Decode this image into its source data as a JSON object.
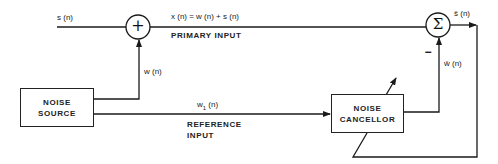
{
  "diagram": {
    "nodes": {
      "noise_source": {
        "line1": "NOISE",
        "line2": "SOURCE"
      },
      "noise_cancellor": {
        "line1": "NOISE",
        "line2": "CANCELLOR"
      },
      "adder": {
        "symbol": "+"
      },
      "summer": {
        "symbol": "Σ",
        "minus_sign": "−"
      }
    },
    "signals": {
      "s": "s (n)",
      "x": "x (n) = w (n) + s (n)",
      "primary_input": "PRIMARY INPUT",
      "w": "w (n)",
      "w1_base": "w",
      "w1_sub": "1",
      "w1_suffix": " (n)",
      "reference_input_line1": "REFERENCE",
      "reference_input_line2": "INPUT",
      "s_hat": "ŝ (n)",
      "w_hat": "ŵ (n)"
    },
    "colors": {
      "line": "#1a1a1a",
      "background": "#ffffff"
    }
  }
}
